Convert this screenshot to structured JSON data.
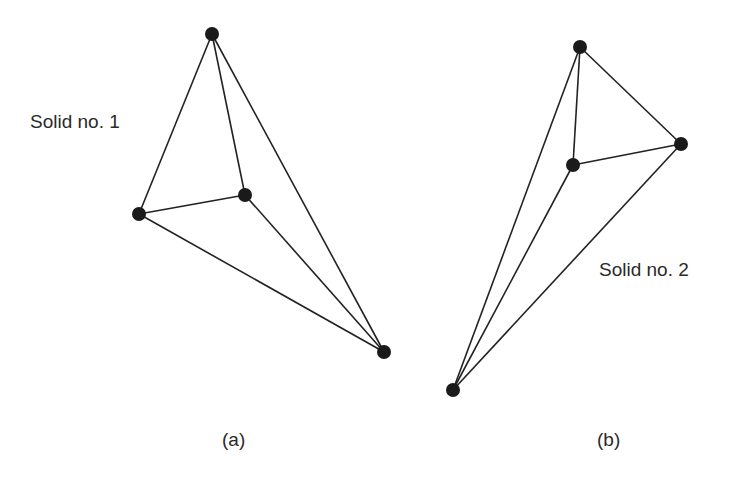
{
  "solids": [
    {
      "id": "solid-1",
      "label": "Solid no. 1",
      "label_pos": [
        30,
        112
      ],
      "caption": "(a)",
      "caption_pos": [
        222,
        430
      ],
      "nodes": [
        [
          212,
          34
        ],
        [
          139,
          214
        ],
        [
          245,
          195
        ],
        [
          384,
          352
        ]
      ],
      "edges": [
        [
          0,
          1
        ],
        [
          0,
          2
        ],
        [
          0,
          3
        ],
        [
          1,
          2
        ],
        [
          1,
          3
        ],
        [
          2,
          3
        ]
      ]
    },
    {
      "id": "solid-2",
      "label": "Solid no. 2",
      "label_pos": [
        599,
        260
      ],
      "caption": "(b)",
      "caption_pos": [
        597,
        430
      ],
      "nodes": [
        [
          580,
          47
        ],
        [
          681,
          144
        ],
        [
          573,
          165
        ],
        [
          453,
          390
        ]
      ],
      "edges": [
        [
          0,
          1
        ],
        [
          0,
          2
        ],
        [
          0,
          3
        ],
        [
          1,
          2
        ],
        [
          1,
          3
        ],
        [
          2,
          3
        ]
      ]
    }
  ],
  "style": {
    "line_color": "#222222",
    "node_color": "#1a1a1a",
    "node_radius": 7
  }
}
